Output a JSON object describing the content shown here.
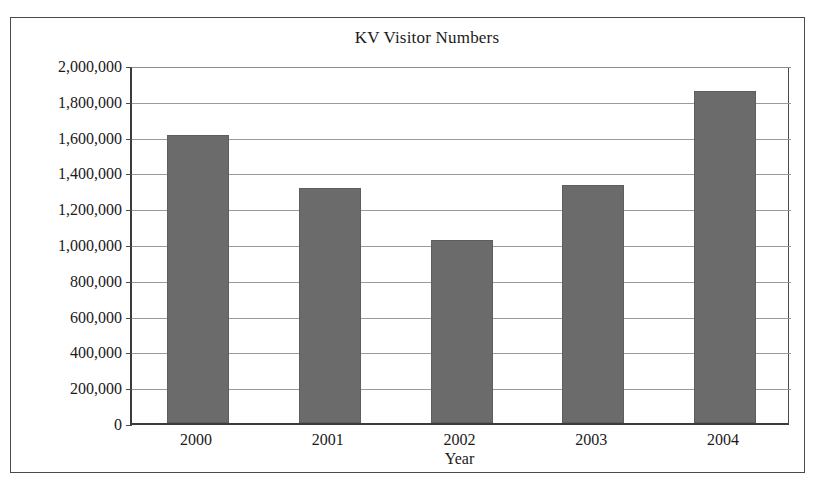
{
  "figure": {
    "background_color": "#ffffff",
    "frame_color": "#4a4a4a",
    "x_axis_title": "Year"
  },
  "chart_data": {
    "type": "bar",
    "title": "KV Visitor Numbers",
    "xlabel": "Year",
    "ylabel": "",
    "categories": [
      "2000",
      "2001",
      "2002",
      "2003",
      "2004"
    ],
    "values": [
      1610000,
      1315000,
      1020000,
      1330000,
      1855000
    ],
    "ylim": [
      0,
      2000000
    ],
    "ytick_values": [
      0,
      200000,
      400000,
      600000,
      800000,
      1000000,
      1200000,
      1400000,
      1600000,
      1800000,
      2000000
    ],
    "ytick_labels": [
      "2,000,000",
      "1,800,000",
      "1,600,000",
      "1,400,000",
      "1,200,000",
      "1,000,000",
      "800,000",
      "600,000",
      "400,000",
      "200,000",
      "0"
    ],
    "grid": true,
    "grid_color": "#9a9a9a",
    "legend": null,
    "bar_color": "#6b6b6b",
    "bar_edge_color": "#5e5e5e"
  }
}
